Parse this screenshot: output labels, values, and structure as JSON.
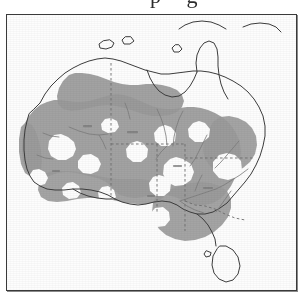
{
  "page": {
    "background_color": "#ffffff",
    "clipped_caption_fragment": "p g"
  },
  "map": {
    "title": "Map of Australia showing arid and semi-arid zones",
    "region": "Australia",
    "frame": {
      "border_color": "#3a3a3a",
      "background_color": "#fdfdfd",
      "x": 6,
      "y": 14,
      "width": 289,
      "height": 275
    },
    "projection_note": "equirectangular, continental extent",
    "colors": {
      "shaded_zone": "#9a9a9a",
      "unshaded_zone": "#fdfdfd",
      "coastline": "#3c3c3c",
      "state_border": "#6d6d6d",
      "river": "#7b7b7b"
    },
    "legend": {
      "shaded_label": "arid / semi-arid zone",
      "unshaded_label": "non-arid land"
    },
    "features": {
      "landmasses": [
        "Australian mainland",
        "Tasmania",
        "Melville Island",
        "Groote Eylandt",
        "Kangaroo Island",
        "New Guinea (partial, top edge)"
      ],
      "state_borders_style": "dashed",
      "illegible_interior_labels": true
    }
  }
}
